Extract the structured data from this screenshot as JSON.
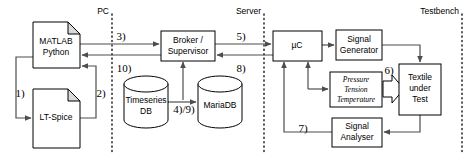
{
  "diagram": {
    "zones": [
      {
        "id": "pc",
        "label": "PC",
        "divider_x": 112
      },
      {
        "id": "server",
        "label": "Server",
        "divider_x": 264
      },
      {
        "id": "testbench",
        "label": "Testbench",
        "divider_x": 462
      }
    ],
    "nodes": {
      "matlab": {
        "line1": "MATLAB",
        "line2": "Python"
      },
      "ltspice": {
        "label": "LT-Spice"
      },
      "broker": {
        "line1": "Broker /",
        "line2": "Supervisor"
      },
      "timeseries_db": {
        "line1": "Timeseries",
        "line2": "DB"
      },
      "mariadb": {
        "label": "MariaDB"
      },
      "microcontroller": {
        "label": "µC"
      },
      "signal_generator": {
        "line1": "Signal",
        "line2": "Generator"
      },
      "sensors": {
        "line1": "Pressure",
        "line2": "Tension",
        "line3": "Temperature"
      },
      "textile": {
        "line1": "Textile",
        "line2": "under",
        "line3": "Test"
      },
      "signal_analyser": {
        "line1": "Signal",
        "line2": "Analyser"
      }
    },
    "steps": [
      {
        "id": "step1",
        "label": "1)",
        "x": 20,
        "y": 94
      },
      {
        "id": "step2",
        "label": "2)",
        "x": 101,
        "y": 94
      },
      {
        "id": "step3",
        "label": "3)",
        "x": 121,
        "y": 37
      },
      {
        "id": "step4-9",
        "label": "4)/9)",
        "x": 184,
        "y": 110
      },
      {
        "id": "step5",
        "label": "5)",
        "x": 241,
        "y": 37
      },
      {
        "id": "step6",
        "label": "6)",
        "x": 389,
        "y": 71
      },
      {
        "id": "step7",
        "label": "7)",
        "x": 303,
        "y": 129
      },
      {
        "id": "step8",
        "label": "8)",
        "x": 241,
        "y": 69
      },
      {
        "id": "step10",
        "label": "10)",
        "x": 124,
        "y": 69
      }
    ],
    "colors": {
      "stroke": "#000000",
      "flow": "#4d4d4d",
      "fold_fill": "#d9d9d9",
      "background": "#ffffff"
    }
  }
}
